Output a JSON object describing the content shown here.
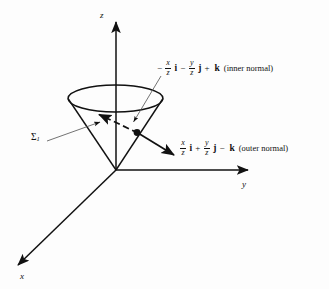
{
  "figure": {
    "type": "3d-vector-diagram",
    "background_color": "#fdfdfd",
    "line_color": "#111111"
  },
  "axes": {
    "z": {
      "label": "z",
      "direction": "up"
    },
    "y": {
      "label": "y",
      "direction": "right"
    },
    "x": {
      "label": "x",
      "direction": "down-left"
    }
  },
  "surface": {
    "label_symbol": "Σ",
    "label_subscript": "1",
    "shape": "cone"
  },
  "inner_normal": {
    "sign_lead": "−",
    "term1": {
      "num": "x",
      "den": "z",
      "unit": "i"
    },
    "op": "−",
    "term2": {
      "num": "y",
      "den": "z",
      "unit": "j"
    },
    "op2": "+",
    "term3": {
      "unit": "k"
    },
    "annotation": "(inner normal)",
    "arrow_style": "dashed"
  },
  "outer_normal": {
    "term1": {
      "num": "x",
      "den": "z",
      "unit": "i"
    },
    "op": "+",
    "term2": {
      "num": "y",
      "den": "z",
      "unit": "j"
    },
    "op2": "−",
    "term3": {
      "unit": "k"
    },
    "annotation": "(outer normal)",
    "arrow_style": "solid"
  },
  "point": {
    "name": "surface-point",
    "marker": "filled-dot"
  }
}
